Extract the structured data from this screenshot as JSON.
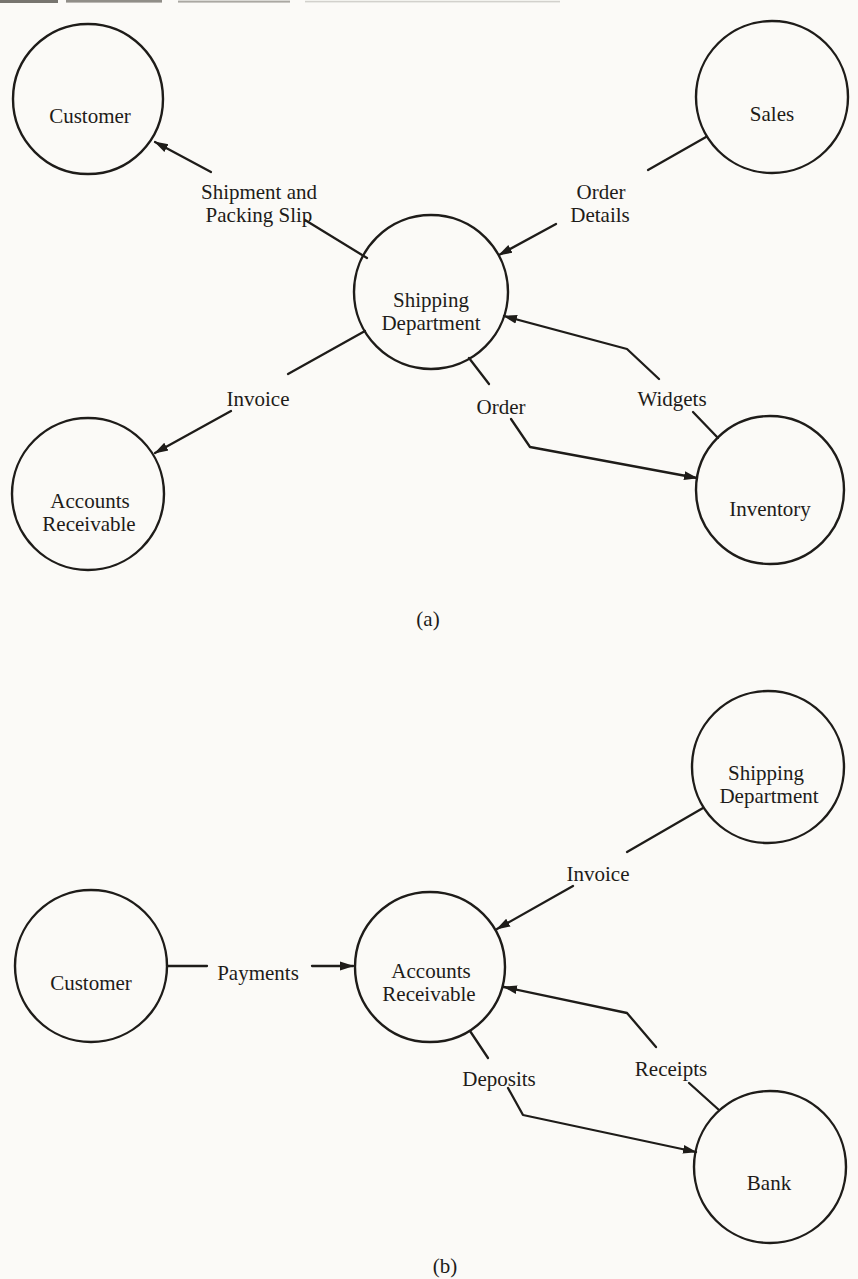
{
  "colors": {
    "ink": "#1e1c19",
    "paper": "#fbfaf7"
  },
  "figure": {
    "diagram_a": {
      "caption": "(a)",
      "nodes": {
        "customer": {
          "label": "Customer"
        },
        "sales": {
          "label": "Sales"
        },
        "shipping_department": {
          "line1": "Shipping",
          "line2": "Department"
        },
        "accounts_receivable": {
          "line1": "Accounts",
          "line2": "Receivable"
        },
        "inventory": {
          "label": "Inventory"
        }
      },
      "flows": [
        {
          "from": "shipping_department",
          "to": "customer",
          "line1": "Shipment and",
          "line2": "Packing Slip"
        },
        {
          "from": "sales",
          "to": "shipping_department",
          "line1": "Order",
          "line2": "Details"
        },
        {
          "from": "shipping_department",
          "to": "accounts_receivable",
          "label": "Invoice"
        },
        {
          "from": "shipping_department",
          "to": "inventory",
          "label": "Order"
        },
        {
          "from": "inventory",
          "to": "shipping_department",
          "label": "Widgets"
        }
      ]
    },
    "diagram_b": {
      "caption": "(b)",
      "nodes": {
        "customer": {
          "label": "Customer"
        },
        "shipping_department": {
          "line1": "Shipping",
          "line2": "Department"
        },
        "accounts_receivable": {
          "line1": "Accounts",
          "line2": "Receivable"
        },
        "bank": {
          "label": "Bank"
        }
      },
      "flows": [
        {
          "from": "customer",
          "to": "accounts_receivable",
          "label": "Payments"
        },
        {
          "from": "shipping_department",
          "to": "accounts_receivable",
          "label": "Invoice"
        },
        {
          "from": "accounts_receivable",
          "to": "bank",
          "label": "Deposits"
        },
        {
          "from": "bank",
          "to": "accounts_receivable",
          "label": "Receipts"
        }
      ]
    }
  }
}
